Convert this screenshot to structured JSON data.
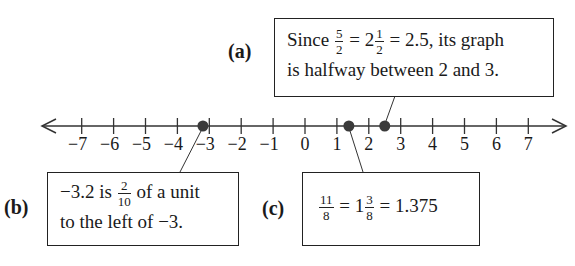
{
  "number_line": {
    "min": -7,
    "max": 7,
    "tick_labels": [
      "−7",
      "−6",
      "−5",
      "−4",
      "−3",
      "−2",
      "−1",
      "0",
      "1",
      "2",
      "3",
      "4",
      "5",
      "6",
      "7"
    ],
    "arrows": "both",
    "plotted_points": [
      {
        "label": "b",
        "value": -3.2
      },
      {
        "label": "c",
        "value": 1.375
      },
      {
        "label": "a",
        "value": 2.5
      }
    ],
    "point_color": "#3a3a3a"
  },
  "callouts": {
    "a": {
      "tag": "(a)",
      "pre": "Since ",
      "frac1_num": "5",
      "frac1_den": "2",
      "eq1": " = 2",
      "frac2_num": "1",
      "frac2_den": "2",
      "post": " = 2.5, its graph",
      "line2": "is halfway between 2 and 3."
    },
    "b": {
      "tag": "(b)",
      "pre": "−3.2 is ",
      "frac_num": "2",
      "frac_den": "10",
      "post": " of a unit",
      "line2": "to the left of −3."
    },
    "c": {
      "tag": "(c)",
      "frac1_num": "11",
      "frac1_den": "8",
      "eq1": " = 1",
      "frac2_num": "3",
      "frac2_den": "8",
      "post": " = 1.375"
    }
  }
}
